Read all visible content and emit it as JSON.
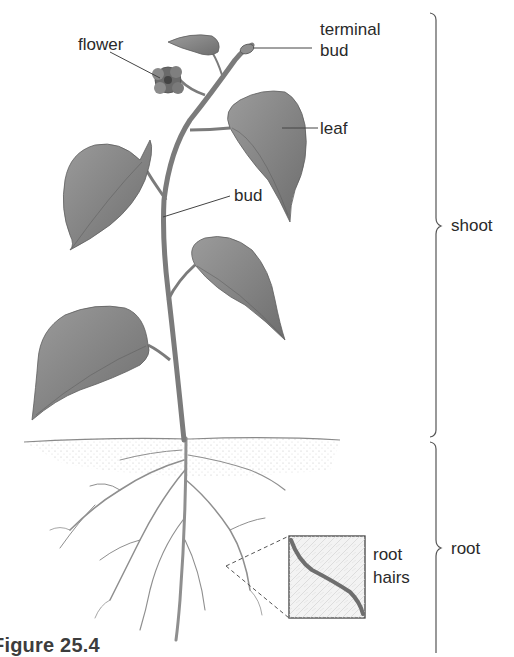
{
  "figure": {
    "caption": "Figure 25.4"
  },
  "labels": {
    "flower": "flower",
    "terminal_bud_line1": "terminal",
    "terminal_bud_line2": "bud",
    "leaf": "leaf",
    "bud": "bud",
    "root_hairs_line1": "root",
    "root_hairs_line2": "hairs"
  },
  "brackets": {
    "shoot": "shoot",
    "root": "root"
  },
  "colors": {
    "ink": "#2a2a2a",
    "leaf_fill": "#8a8a8a",
    "leaf_dark": "#6f6f6f",
    "stem": "#7a7a7a",
    "root": "#9a9a9a",
    "soil": "#cfcfcf"
  }
}
